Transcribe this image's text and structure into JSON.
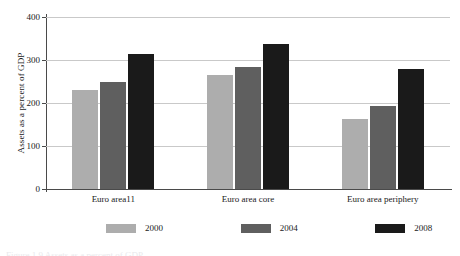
{
  "chart_data": {
    "type": "bar",
    "title": "",
    "subtitle": "",
    "xlabel": "",
    "ylabel": "Assets as a percent of GDP",
    "ylim": [
      0,
      400
    ],
    "yticks": [
      0,
      100,
      200,
      300,
      400
    ],
    "ytick_labels": [
      "0",
      "100",
      "200",
      "300",
      "400"
    ],
    "grid": "horizontal",
    "legend_position": "bottom-center",
    "categories": [
      "Euro area11",
      "Euro area core",
      "Euro area periphery"
    ],
    "series": [
      {
        "name": "2000",
        "color": "#adadad",
        "values": [
          230,
          265,
          163
        ]
      },
      {
        "name": "2004",
        "color": "#5f5f5f",
        "values": [
          250,
          283,
          193
        ]
      },
      {
        "name": "2008",
        "color": "#1a1a1a",
        "values": [
          315,
          337,
          278
        ]
      }
    ],
    "annotations": []
  },
  "caption": {
    "sliver_text": "Figure 1.9  Assets as a percent of GDP"
  }
}
